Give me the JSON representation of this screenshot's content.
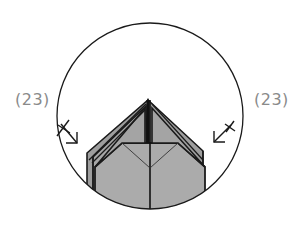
{
  "diagram": {
    "type": "origami-step-detail",
    "labels": {
      "left_step_ref": "(23)",
      "right_step_ref": "(23)"
    },
    "colors": {
      "paper_fill": "#a9a9a9",
      "paper_fill_dark": "#9b9b9b",
      "outline": "#1a1a1a",
      "label_text": "#8a8a8a",
      "background": "#ffffff"
    },
    "symbols": {
      "left_arrow": "inside-reverse-fold-arrow",
      "right_arrow": "inside-reverse-fold-arrow"
    },
    "detail_circle": {
      "cx": 150,
      "cy": 116,
      "r": 93
    }
  }
}
